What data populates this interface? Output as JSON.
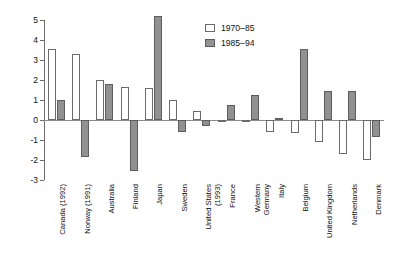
{
  "chart_data": {
    "type": "bar",
    "title": "",
    "subtitle": "",
    "xlabel": "",
    "ylabel": "",
    "ylim": [
      -3,
      5
    ],
    "ytick_labels": [
      "5",
      "4",
      "3",
      "2",
      "1",
      "0",
      "-1",
      "-2",
      "-3"
    ],
    "yticks": [
      5,
      4,
      3,
      2,
      1,
      0,
      -1,
      -2,
      -3
    ],
    "grid": false,
    "legend_position": "top-center-right",
    "categories": [
      "Canada (1992)",
      "Norway (1991)",
      "Australia",
      "Finland",
      "Japan",
      "Sweden",
      "United States\n(1993)",
      "France",
      "Western\nGermany",
      "Italy",
      "Belgium",
      "United Kingdom",
      "Netherlands",
      "Denmark"
    ],
    "series": [
      {
        "name": "1970–85",
        "color": "#ffffff",
        "values": [
          3.55,
          3.3,
          2.0,
          1.65,
          1.6,
          1.0,
          0.45,
          -0.1,
          -0.05,
          -0.6,
          -0.65,
          -1.1,
          -1.7,
          -2.0
        ]
      },
      {
        "name": "1985–94",
        "color": "#919191",
        "values": [
          1.0,
          -1.85,
          1.8,
          -2.55,
          5.2,
          -0.6,
          -0.3,
          0.75,
          1.25,
          0.1,
          3.55,
          1.45,
          1.45,
          -0.85
        ]
      }
    ]
  },
  "legend": {
    "entries": [
      {
        "label": "1970–85",
        "swatch": "light"
      },
      {
        "label": "1985–94",
        "swatch": "dark"
      }
    ]
  }
}
